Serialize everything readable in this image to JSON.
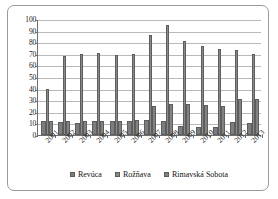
{
  "chart_data": {
    "type": "bar",
    "title": "",
    "subtitle": "",
    "xlabel": "",
    "ylabel": "",
    "ylim": [
      0,
      100
    ],
    "ytick_step": 10,
    "yticks": [
      0,
      10,
      20,
      30,
      40,
      50,
      60,
      70,
      80,
      90,
      100
    ],
    "grid": true,
    "legend_position": "bottom",
    "categories": [
      "2001",
      "2002",
      "2003",
      "2004",
      "2005",
      "2006",
      "2007",
      "2008",
      "2009",
      "2010",
      "2011",
      "2012",
      "2013"
    ],
    "series": [
      {
        "name": "Revúca",
        "color": "#7d7d7d",
        "values": [
          12,
          11,
          10,
          12,
          12,
          12,
          13,
          12,
          8,
          7,
          7,
          11,
          10
        ]
      },
      {
        "name": "Rožňava",
        "color": "#8a8a8a",
        "values": [
          40,
          68,
          70,
          71,
          69,
          70,
          86,
          95,
          81,
          77,
          74,
          73,
          70
        ]
      },
      {
        "name": "Rimavská Sobota",
        "color": "#828282",
        "values": [
          12,
          12,
          12,
          12,
          12,
          13,
          25,
          27,
          27,
          26,
          25,
          31,
          31
        ]
      }
    ]
  },
  "legend": {
    "items": [
      {
        "label": "Revúca"
      },
      {
        "label": "Rožňava"
      },
      {
        "label": "Rimavská Sobota"
      }
    ]
  },
  "colors": {
    "frame_border": "#9a9a9a",
    "axis": "#6e6e6e",
    "gridline": "#b9b9b9",
    "background": "#ffffff",
    "text": "#1a1a1a"
  }
}
